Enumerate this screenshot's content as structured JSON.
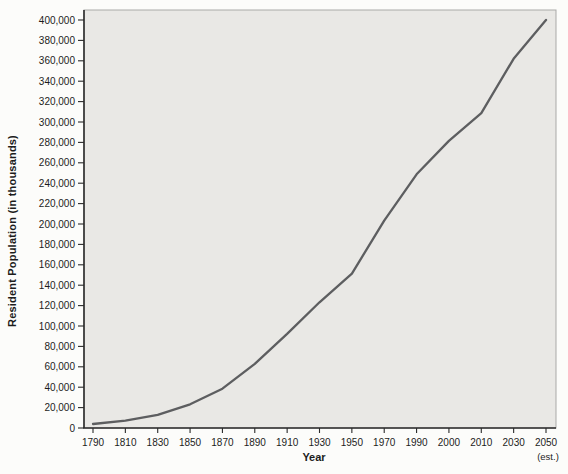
{
  "chart": {
    "ylabel": "Resident Population (in thousands)",
    "xlabel": "Year",
    "est_note": "(est.)"
  },
  "chart_data": {
    "type": "line",
    "title": "",
    "xlabel": "Year",
    "ylabel": "Resident Population (in thousands)",
    "categories": [
      "1790",
      "1810",
      "1830",
      "1850",
      "1870",
      "1890",
      "1910",
      "1930",
      "1950",
      "1970",
      "1990",
      "2000",
      "2010",
      "2030",
      "2050"
    ],
    "values": [
      3929,
      7240,
      12866,
      23192,
      38558,
      62980,
      92228,
      123203,
      151326,
      203302,
      248710,
      281422,
      308746,
      362000,
      400000
    ],
    "last_category_note": "(est.)",
    "ylim": [
      0,
      400000
    ],
    "y_tick_step": 20000,
    "y_tick_format": "thousands-comma",
    "grid": false,
    "legend": "none",
    "line_color": "#5d5e60",
    "plot_bg": "#e9e8e5",
    "frame_color": "#a9a9a7",
    "axis_color": "#2b2b2b",
    "label_color": "#1c1c1c"
  }
}
